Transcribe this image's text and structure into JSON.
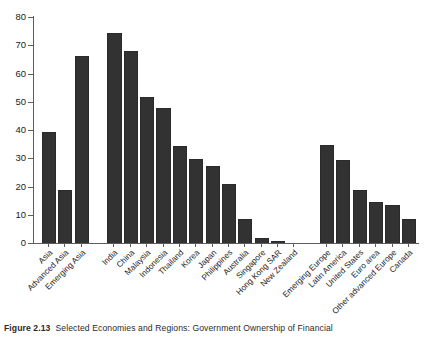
{
  "caption": {
    "figure_number": "Figure 2.13",
    "text": "Selected Economies and Regions: Government Ownership of Financial"
  },
  "chart_data": {
    "type": "bar",
    "title": "",
    "xlabel": "",
    "ylabel": "",
    "ylim": [
      0,
      80
    ],
    "yticks": [
      0,
      10,
      20,
      30,
      40,
      50,
      60,
      70,
      80
    ],
    "grid": false,
    "legend": "none",
    "bar_color": "#323232",
    "axis_color": "#5d5d5d",
    "categories": [
      "Asia",
      "Advanced Asia",
      "Emerging Asia",
      "India",
      "China",
      "Malaysia",
      "Indonesia",
      "Thailand",
      "Korea",
      "Japan",
      "Philippines",
      "Australia",
      "Singapore",
      "Hong Kong SAR",
      "New Zealand",
      "Emerging Europe",
      "Latin America",
      "United States",
      "Euro area",
      "Other advanced Europe",
      "Canada"
    ],
    "values": [
      39,
      18.5,
      66,
      74,
      67.5,
      51.5,
      47.5,
      34,
      29.5,
      27,
      20.5,
      8,
      1.5,
      0.3,
      0,
      34.5,
      29,
      18.5,
      14,
      13,
      8
    ],
    "groups": [
      {
        "name": "aggregates",
        "start": 0,
        "count": 3
      },
      {
        "name": "asia-economies",
        "start": 3,
        "count": 12
      },
      {
        "name": "other-regions",
        "start": 15,
        "count": 6
      }
    ]
  }
}
